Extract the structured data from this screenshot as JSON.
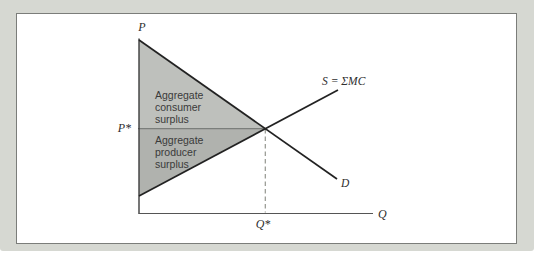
{
  "figure": {
    "axis_labels": {
      "y": "P",
      "x": "Q",
      "equilibrium_price": "P*",
      "equilibrium_quantity": "Q*"
    },
    "curves": {
      "supply_label": "S = ΣMC",
      "demand_label": "D"
    },
    "regions": {
      "consumer_surplus": {
        "lines": [
          "Aggregate",
          "consumer",
          "surplus"
        ],
        "fill": "#bec0bc"
      },
      "producer_surplus": {
        "lines": [
          "Aggregate",
          "producer",
          "surplus"
        ],
        "fill": "#b0b2ae"
      }
    },
    "colors": {
      "background": "#d6d8d2",
      "panel_background": "#ffffff",
      "panel_border": "#7b7d7a",
      "curve_stroke": "#222222",
      "axis_stroke": "#3d3d3d",
      "price_line_stroke": "#6b6d6a",
      "dashed_line_stroke": "#94968f"
    }
  }
}
